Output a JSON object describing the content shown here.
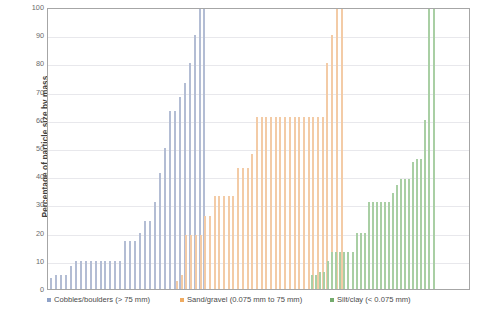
{
  "chart_data": {
    "type": "bar",
    "title": "",
    "subtitle": "",
    "xlabel": "",
    "ylabel": "Percentage of particle size by mass",
    "ylim": [
      0,
      100
    ],
    "yticks": [
      0,
      10,
      20,
      30,
      40,
      50,
      60,
      70,
      80,
      90,
      100
    ],
    "grid": true,
    "legend_position": "bottom",
    "axis_tick_labels": [
      "0",
      "10",
      "20",
      "30",
      "40",
      "50",
      "60",
      "70",
      "80",
      "90",
      "100"
    ],
    "series": [
      {
        "name": "Cobbles/boulders (> 75 mm)",
        "color": "#b3bdd4",
        "legend_color": "#8fa2c8",
        "values": [
          4,
          5,
          5,
          5,
          8,
          10,
          10,
          10,
          10,
          10,
          10,
          10,
          10,
          10,
          10,
          17,
          17,
          17,
          20,
          24,
          24,
          31,
          41,
          50,
          63,
          63,
          68,
          73,
          80,
          90,
          100,
          100
        ]
      },
      {
        "name": "Sand/gravel (0.075 mm to 75 mm)",
        "color": "#f3cba6",
        "legend_color": "#efab61",
        "values": [
          3,
          5,
          19,
          19,
          19,
          19,
          26,
          26,
          33,
          33,
          33,
          33,
          33,
          43,
          43,
          43,
          48,
          61,
          61,
          61,
          61,
          61,
          61,
          61,
          61,
          61,
          61,
          61,
          61,
          61,
          61,
          61,
          80,
          90,
          100,
          100
        ]
      },
      {
        "name": "Silt/clay (< 0.075 mm)",
        "color": "#a9cfa4",
        "legend_color": "#74ab6d",
        "values": [
          5,
          5,
          6,
          6,
          10,
          13,
          13,
          13,
          13,
          13,
          13,
          20,
          20,
          20,
          31,
          31,
          31,
          31,
          31,
          31,
          34,
          37,
          39,
          39,
          39,
          45,
          46,
          46,
          60,
          100,
          100
        ]
      }
    ]
  },
  "legend": {
    "entries": [
      {
        "label": "Cobbles/boulders (> 75 mm)"
      },
      {
        "label": "Sand/gravel (0.075 mm to 75 mm)"
      },
      {
        "label": "Silt/clay (< 0.075 mm)"
      }
    ]
  },
  "axes": {
    "y_title": "Percentage of particle size by mass"
  }
}
